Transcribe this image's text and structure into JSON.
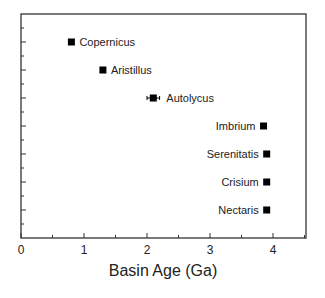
{
  "chart_data": {
    "type": "scatter",
    "title": "",
    "xlabel": "Basin Age (Ga)",
    "ylabel": "",
    "xlim": [
      0,
      4.5
    ],
    "xticks": [
      0,
      1,
      2,
      3,
      4
    ],
    "xtick_labels": [
      "0",
      "1",
      "2",
      "3",
      "4"
    ],
    "grid": false,
    "legend": null,
    "points": [
      {
        "label": "Copernicus",
        "x": 0.8,
        "row": 1,
        "label_side": "right"
      },
      {
        "label": "Aristillus",
        "x": 1.3,
        "row": 2,
        "label_side": "right"
      },
      {
        "label": "Autolycus",
        "x": 2.1,
        "xerr": 0.1,
        "row": 3,
        "label_side": "right"
      },
      {
        "label": "Imbrium",
        "x": 3.85,
        "row": 4,
        "label_side": "left"
      },
      {
        "label": "Serenitatis",
        "x": 3.9,
        "row": 5,
        "label_side": "left"
      },
      {
        "label": "Crisium",
        "x": 3.9,
        "row": 6,
        "label_side": "left"
      },
      {
        "label": "Nectaris",
        "x": 3.9,
        "row": 7,
        "label_side": "left"
      }
    ],
    "marker": "square",
    "marker_color": "#000000"
  }
}
